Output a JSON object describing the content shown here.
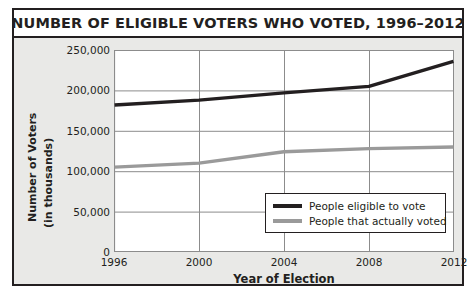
{
  "chart_data": {
    "type": "line",
    "title": "NUMBER OF ELIGIBLE VOTERS WHO VOTED, 1996–2012",
    "xlabel": "Year of Election",
    "ylabel_line1": "Number of Voters",
    "ylabel_line2": "(in thousands)",
    "categories": [
      1996,
      2000,
      2004,
      2008,
      2012
    ],
    "xtick_labels": [
      "1996",
      "2000",
      "2004",
      "2008",
      "2012"
    ],
    "ytick_labels": [
      "250,000",
      "200,000",
      "150,000",
      "100,000",
      "50,000",
      "0"
    ],
    "ytick_values": [
      250000,
      200000,
      150000,
      100000,
      50000,
      0
    ],
    "ylim": [
      0,
      250000
    ],
    "xlim": [
      1996,
      2012
    ],
    "grid": true,
    "legend_position": "inside-lower-right",
    "series": [
      {
        "name": "People eligible to vote",
        "color": "#231f20",
        "values": [
          182000,
          188000,
          197000,
          205000,
          236000
        ]
      },
      {
        "name": "People that actually voted",
        "color": "#9a9a9a",
        "values": [
          105000,
          110000,
          124000,
          128000,
          130000
        ]
      }
    ]
  },
  "legend": {
    "items": [
      {
        "label": "People eligible to vote",
        "color": "#231f20"
      },
      {
        "label": "People that actually voted",
        "color": "#9a9a9a"
      }
    ]
  },
  "colors": {
    "ink": "#231f20",
    "panel_background": "#e9e9e7",
    "plot_background": "#ffffff",
    "gridline": "#8c8c8c",
    "series_dark": "#231f20",
    "series_light": "#9a9a9a"
  }
}
